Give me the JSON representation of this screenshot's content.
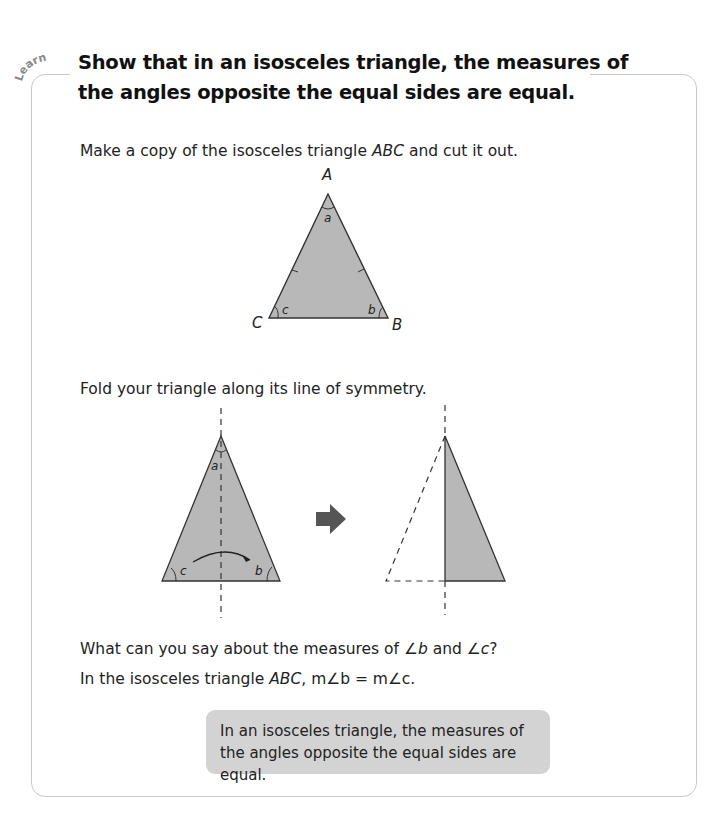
{
  "section_tag": "Learn",
  "title": "Show that in an isosceles triangle, the  measures of the angles opposite the equal sides are equal.",
  "steps": {
    "step1_prefix": "Make a copy of the isosceles triangle ",
    "step1_var": "ABC",
    "step1_suffix": " and cut it out.",
    "step2": "Fold your triangle along its line of symmetry.",
    "question_prefix": "What can you say about the measures of ",
    "question_b": "∠b",
    "question_mid": " and ",
    "question_c": "∠c",
    "question_suffix": "?",
    "answer_prefix": "In the isosceles triangle ",
    "answer_var": "ABC",
    "answer_suffix": ", m∠b = m∠c."
  },
  "figure1": {
    "vertex_A": "A",
    "vertex_B": "B",
    "vertex_C": "C",
    "angle_a": "a",
    "angle_b": "b",
    "angle_c": "c",
    "fill": "#b8b8b8"
  },
  "figure2": {
    "angle_a": "a",
    "angle_b": "b",
    "angle_c": "c",
    "arrow_icon": "right-arrow",
    "fill": "#b8b8b8"
  },
  "conclusion": "In an isosceles triangle, the measures of the angles opposite the equal sides are equal."
}
